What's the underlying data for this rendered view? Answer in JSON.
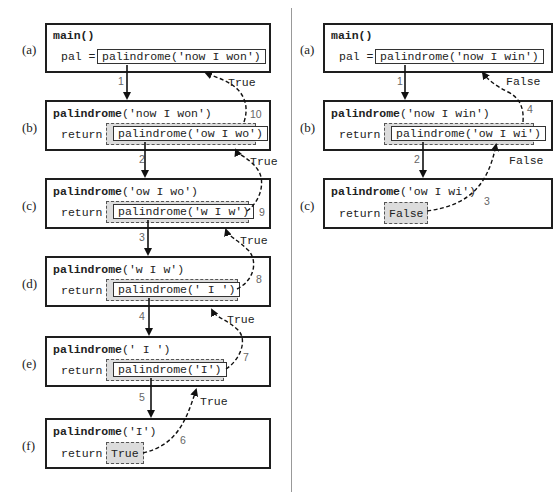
{
  "left_panel": {
    "frames": [
      {
        "label": "(a)",
        "title_fn": "main",
        "title_args": "()",
        "prefix": "pal =",
        "call": "palindrome('now I won')",
        "kind": "call"
      },
      {
        "label": "(b)",
        "title_fn": "palindrome",
        "title_args": "('now I won')",
        "prefix": "return",
        "call": "palindrome('ow I wo')",
        "kind": "call"
      },
      {
        "label": "(c)",
        "title_fn": "palindrome",
        "title_args": "('ow I wo')",
        "prefix": "return",
        "call": "palindrome('w I w')",
        "kind": "call"
      },
      {
        "label": "(d)",
        "title_fn": "palindrome",
        "title_args": "('w I w')",
        "prefix": "return",
        "call": "palindrome(' I ')",
        "kind": "call"
      },
      {
        "label": "(e)",
        "title_fn": "palindrome",
        "title_args": "(' I ')",
        "prefix": "return",
        "call": "palindrome('I')",
        "kind": "call"
      },
      {
        "label": "(f)",
        "title_fn": "palindrome",
        "title_args": "('I')",
        "prefix": "return",
        "call": "True",
        "kind": "value"
      }
    ],
    "call_steps": [
      "1",
      "2",
      "3",
      "4",
      "5"
    ],
    "return_steps": [
      "6",
      "7",
      "8",
      "9",
      "10"
    ],
    "return_values": [
      "True",
      "True",
      "True",
      "True",
      "True"
    ]
  },
  "right_panel": {
    "frames": [
      {
        "label": "(a)",
        "title_fn": "main",
        "title_args": "()",
        "prefix": "pal =",
        "call": "palindrome('now I win')",
        "kind": "call"
      },
      {
        "label": "(b)",
        "title_fn": "palindrome",
        "title_args": "('now I win')",
        "prefix": "return",
        "call": "palindrome('ow I wi')",
        "kind": "call"
      },
      {
        "label": "(c)",
        "title_fn": "palindrome",
        "title_args": "('ow I wi')",
        "prefix": "return",
        "call": "False",
        "kind": "value"
      }
    ],
    "call_steps": [
      "1",
      "2"
    ],
    "return_steps": [
      "3",
      "4"
    ],
    "return_values": [
      "False",
      "False"
    ]
  }
}
